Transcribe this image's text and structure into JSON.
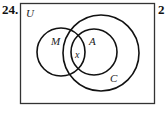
{
  "problem_number": "24.",
  "next_problem_number": "2",
  "diagram": {
    "type": "venn",
    "universe_label": "U",
    "sets": [
      {
        "label": "M",
        "cx": 61,
        "cy": 52,
        "r": 24
      },
      {
        "label": "A",
        "cx": 94,
        "cy": 52,
        "r": 23
      },
      {
        "label": "C",
        "cx": 101,
        "cy": 53,
        "r": 38
      }
    ],
    "region_label": "x",
    "region_label_description": "intersection of M, A and C",
    "stroke_color": "#111111"
  }
}
